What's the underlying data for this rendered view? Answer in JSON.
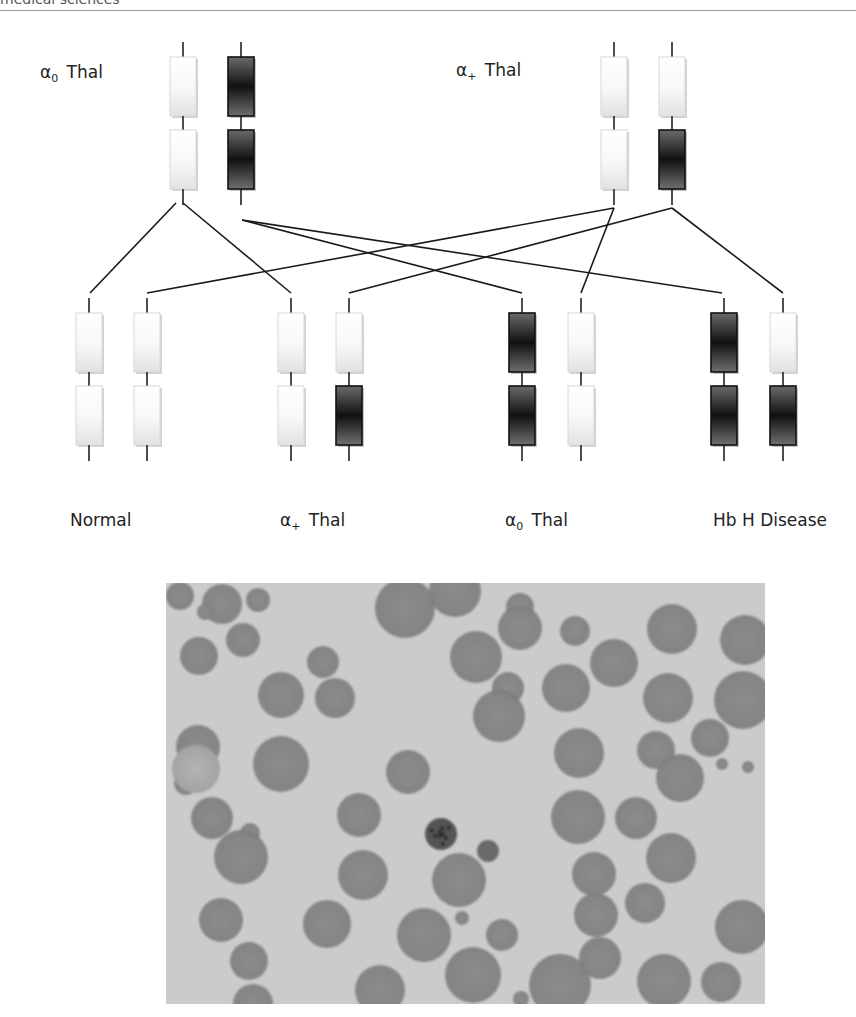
{
  "header": {
    "text": "medical sciences"
  },
  "figure": {
    "parents": [
      {
        "id": "p1",
        "label_main": "α",
        "label_sub": "0",
        "label_tail": " Thal",
        "label_x": 40,
        "label_y": 62,
        "chromosomes": [
          {
            "x": 183,
            "genes": [
              "normal",
              "normal"
            ]
          },
          {
            "x": 241,
            "genes": [
              "deleted",
              "deleted"
            ]
          }
        ]
      },
      {
        "id": "p2",
        "label_main": "α",
        "label_sub": "+",
        "label_tail": " Thal",
        "label_x": 456,
        "label_y": 60,
        "chromosomes": [
          {
            "x": 614,
            "genes": [
              "normal",
              "normal"
            ]
          },
          {
            "x": 672,
            "genes": [
              "normal",
              "deleted"
            ]
          }
        ]
      }
    ],
    "offspring": [
      {
        "id": "o1",
        "label_main": "Normal",
        "label_sub": "",
        "label_tail": "",
        "label_x": 70,
        "label_y": 510,
        "chromosomes": [
          {
            "x": 89,
            "genes": [
              "normal",
              "normal"
            ]
          },
          {
            "x": 147,
            "genes": [
              "normal",
              "normal"
            ]
          }
        ]
      },
      {
        "id": "o2",
        "label_main": "α",
        "label_sub": "+",
        "label_tail": " Thal",
        "label_x": 280,
        "label_y": 510,
        "chromosomes": [
          {
            "x": 291,
            "genes": [
              "normal",
              "normal"
            ]
          },
          {
            "x": 349,
            "genes": [
              "normal",
              "deleted"
            ]
          }
        ]
      },
      {
        "id": "o3",
        "label_main": "α",
        "label_sub": "0",
        "label_tail": " Thal",
        "label_x": 505,
        "label_y": 510,
        "chromosomes": [
          {
            "x": 522,
            "genes": [
              "deleted",
              "deleted"
            ]
          },
          {
            "x": 581,
            "genes": [
              "normal",
              "normal"
            ]
          }
        ]
      },
      {
        "id": "o4",
        "label_main": "Hb H Disease",
        "label_sub": "",
        "label_tail": "",
        "label_x": 713,
        "label_y": 510,
        "chromosomes": [
          {
            "x": 724,
            "genes": [
              "deleted",
              "deleted"
            ]
          },
          {
            "x": 783,
            "genes": [
              "normal",
              "deleted"
            ]
          }
        ]
      }
    ],
    "gene_legend": {
      "normal": "functional α-globin gene (light)",
      "deleted": "deleted α-globin gene (dark)"
    },
    "cross_lines": [
      {
        "from": [
          176,
          203
        ],
        "to": [
          90,
          293
        ]
      },
      {
        "from": [
          183,
          203
        ],
        "to": [
          291,
          293
        ]
      },
      {
        "from": [
          242,
          220
        ],
        "to": [
          522,
          293
        ]
      },
      {
        "from": [
          242,
          220
        ],
        "to": [
          722,
          293
        ]
      },
      {
        "from": [
          614,
          208
        ],
        "to": [
          147,
          293
        ]
      },
      {
        "from": [
          614,
          208
        ],
        "to": [
          581,
          293
        ]
      },
      {
        "from": [
          672,
          208
        ],
        "to": [
          349,
          293
        ]
      },
      {
        "from": [
          672,
          208
        ],
        "to": [
          783,
          293
        ]
      }
    ],
    "micrograph": {
      "caption": "",
      "cells": [
        [
          180,
          596,
          14
        ],
        [
          222,
          604,
          20
        ],
        [
          258,
          600,
          12
        ],
        [
          243,
          640,
          17
        ],
        [
          199,
          656,
          19
        ],
        [
          205,
          612,
          8
        ],
        [
          281,
          695,
          23
        ],
        [
          335,
          698,
          20
        ],
        [
          323,
          662,
          16
        ],
        [
          405,
          608,
          30
        ],
        [
          455,
          591,
          26
        ],
        [
          520,
          607,
          14
        ],
        [
          520,
          628,
          22
        ],
        [
          575,
          631,
          15
        ],
        [
          566,
          688,
          24
        ],
        [
          614,
          663,
          24
        ],
        [
          476,
          657,
          26
        ],
        [
          508,
          688,
          16
        ],
        [
          672,
          629,
          25
        ],
        [
          745,
          640,
          25
        ],
        [
          668,
          698,
          25
        ],
        [
          743,
          700,
          29
        ],
        [
          656,
          750,
          19
        ],
        [
          710,
          738,
          19
        ],
        [
          722,
          764,
          6
        ],
        [
          748,
          767,
          6
        ],
        [
          680,
          778,
          24
        ],
        [
          198,
          747,
          22
        ],
        [
          186,
          783,
          12
        ],
        [
          281,
          764,
          28
        ],
        [
          212,
          818,
          21
        ],
        [
          250,
          833,
          10
        ],
        [
          359,
          815,
          22
        ],
        [
          499,
          716,
          26
        ],
        [
          408,
          772,
          22
        ],
        [
          579,
          753,
          25
        ],
        [
          241,
          857,
          27
        ],
        [
          221,
          920,
          22
        ],
        [
          249,
          961,
          19
        ],
        [
          253,
          1004,
          20
        ],
        [
          363,
          875,
          25
        ],
        [
          327,
          924,
          24
        ],
        [
          459,
          880,
          27
        ],
        [
          424,
          935,
          27
        ],
        [
          502,
          935,
          16
        ],
        [
          578,
          817,
          27
        ],
        [
          594,
          874,
          22
        ],
        [
          636,
          818,
          21
        ],
        [
          671,
          858,
          25
        ],
        [
          645,
          903,
          20
        ],
        [
          596,
          915,
          22
        ],
        [
          600,
          958,
          21
        ],
        [
          742,
          927,
          27
        ],
        [
          560,
          985,
          31
        ],
        [
          664,
          981,
          27
        ],
        [
          721,
          982,
          20
        ],
        [
          473,
          975,
          28
        ],
        [
          521,
          999,
          8
        ],
        [
          462,
          918,
          7
        ],
        [
          380,
          990,
          25
        ]
      ],
      "inclusion_cell": [
        441,
        834,
        16
      ],
      "small_dark_cell": [
        488,
        851,
        11
      ],
      "ghost_cell": [
        196,
        769,
        24
      ]
    }
  }
}
